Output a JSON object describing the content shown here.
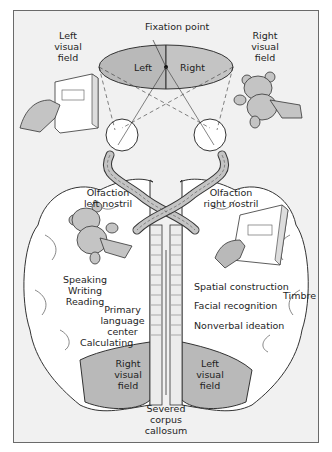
{
  "diagram": {
    "colors": {
      "background": "#f1f1f1",
      "border": "#6a6a6a",
      "shade": "#b9b9b9",
      "brain": "#ffffff",
      "line": "#333333"
    },
    "top": {
      "fixation_point": "Fixation point",
      "left_half": "Left",
      "right_half": "Right",
      "left_visual_field": [
        "Left",
        "visual",
        "field"
      ],
      "right_visual_field": [
        "Right",
        "visual",
        "field"
      ]
    },
    "left_hemisphere": {
      "olfaction": [
        "Olfaction",
        "left nostril"
      ],
      "functions": [
        "Speaking",
        "Writing",
        "Reading"
      ],
      "language": [
        "Primary",
        "language",
        "center"
      ],
      "calculating": "Calculating",
      "visual_field": [
        "Right",
        "visual",
        "field"
      ]
    },
    "right_hemisphere": {
      "olfaction": [
        "Olfaction",
        "right nostril"
      ],
      "spatial": "Spatial construction",
      "facial": "Facial recognition",
      "nonverbal": "Nonverbal ideation",
      "timbre": "Timbre",
      "visual_field": [
        "Left",
        "visual",
        "field"
      ]
    },
    "center": {
      "corpus_callosum": [
        "Severed",
        "corpus",
        "callosum"
      ]
    },
    "icons": [
      "book-icon",
      "teddy-bear-icon",
      "hand-icon",
      "eye-icon"
    ]
  }
}
